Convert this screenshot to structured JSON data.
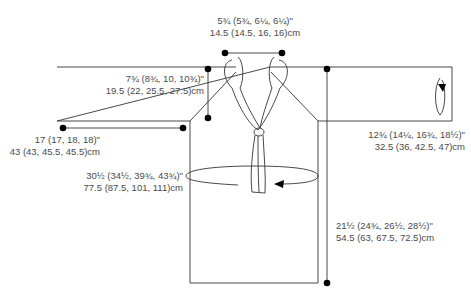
{
  "diagram": {
    "type": "knitting-schematic",
    "garment": "sweater with tie collar",
    "colors": {
      "line": "#333333",
      "dot": "#000000",
      "text": "#4a4a4a"
    },
    "measurements": {
      "neck_width": {
        "inches": "5¾ (5¾, 6¼, 6¼)\"",
        "cm": "14.5 (14.5, 16, 16)cm"
      },
      "armhole_depth": {
        "inches": "7¾ (8¾, 10, 10¾)\"",
        "cm": "19.5 (22, 25.5, 27.5)cm"
      },
      "sleeve_length": {
        "inches": "17 (17, 18, 18)\"",
        "cm": "43 (43, 45.5, 45.5)cm"
      },
      "chest": {
        "inches": "30½ (34½, 39¾, 43¾)\"",
        "cm": "77.5 (87.5, 101, 111)cm"
      },
      "upper_arm": {
        "inches": "12¾ (14¼, 16¾, 18½)\"",
        "cm": "32.5 (36, 42.5, 47)cm"
      },
      "body_length": {
        "inches": "21½ (24¾, 26½, 28½)\"",
        "cm": "54.5 (63, 67.5, 72.5)cm"
      }
    }
  }
}
